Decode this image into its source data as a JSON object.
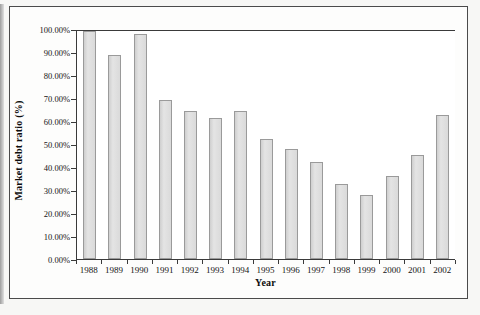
{
  "chart_data": {
    "type": "bar",
    "title": "",
    "xlabel": "Year",
    "ylabel": "Market debt ratio (%)",
    "categories": [
      "1988",
      "1989",
      "1990",
      "1991",
      "1992",
      "1993",
      "1994",
      "1995",
      "1996",
      "1997",
      "1998",
      "1999",
      "2000",
      "2001",
      "2002"
    ],
    "values": [
      99.0,
      88.5,
      98.0,
      69.2,
      64.5,
      61.3,
      64.2,
      52.3,
      47.9,
      42.2,
      32.6,
      27.8,
      36.2,
      45.2,
      62.8
    ],
    "value_labels": [
      "99.00%",
      "88.50%",
      "98.00%",
      "69.20%",
      "64.50%",
      "61.30%",
      "64.20%",
      "52.30%",
      "47.90%",
      "42.20%",
      "32.60%",
      "27.80%",
      "36.20%",
      "45.20%",
      "62.80%"
    ],
    "ylim": [
      0,
      100
    ],
    "ytick_values": [
      0,
      10,
      20,
      30,
      40,
      50,
      60,
      70,
      80,
      90,
      100
    ],
    "ytick_labels": [
      "0.00%",
      "10.00%",
      "20.00%",
      "30.00%",
      "40.00%",
      "50.00%",
      "60.00%",
      "70.00%",
      "80.00%",
      "90.00%",
      "100.00%"
    ],
    "grid": false,
    "legend": "none",
    "bar_fill_color": "#dcdcdc",
    "bar_border_color": "#9a9a9a",
    "axis_color": "#3a3a3a"
  },
  "figure": {
    "background_color": "#fdfdfc",
    "frame_color": "#4b4b4b"
  }
}
